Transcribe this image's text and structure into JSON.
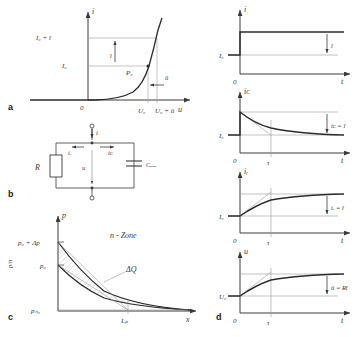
{
  "figure": {
    "panels": [
      "a",
      "b",
      "c",
      "d"
    ],
    "colors": {
      "curve": "#2b2b2b",
      "axis": "#3a3a3a",
      "thin": "#9a9a9a",
      "hatch": "#8a8a8a",
      "text": "#3a3a3a"
    }
  },
  "panel_a": {
    "letter": "a",
    "y_axis_label": "i",
    "x_axis_label": "u",
    "origin_label": "0",
    "y_ticks": [
      "I₀ + î",
      "I₀"
    ],
    "x_ticks": [
      "U₀",
      "U₀ + û"
    ],
    "point_label": "P₀",
    "arrow_labels": [
      "î",
      "û"
    ]
  },
  "panel_b": {
    "letter": "b",
    "total_current": "i",
    "resistor_current": "iᵣ",
    "capacitor_current": "iᴄ",
    "voltage": "u",
    "resistor": "R",
    "capacitor": "Cₑᵢₑₑ"
  },
  "panel_c": {
    "letter": "c",
    "y_axis_label": "p",
    "x_axis_label": "x",
    "origin_label": "",
    "y_ticks": [
      "p₀ + Δp",
      "p₀",
      "pₙ₀"
    ],
    "x_ticks": [
      "Lₚ"
    ],
    "zone_label": "n - Zone",
    "charge_label": "ΔQ",
    "side_label": "p/n"
  },
  "panel_d": {
    "letter": "d",
    "plots": [
      {
        "id": "current-step",
        "y_axis_label": "i",
        "x_axis_label": "t",
        "origin_label": "0",
        "y_tick": "I₀",
        "amplitude_label": "î",
        "tau_label": "",
        "type": "step"
      },
      {
        "id": "capacitor-current",
        "y_axis_label": "iᴄ",
        "x_axis_label": "t",
        "origin_label": "0",
        "y_tick": "I₀",
        "amplitude_label": "iᴄ = î",
        "tau_label": "τ",
        "type": "decay"
      },
      {
        "id": "resistor-current",
        "y_axis_label": "iᵣ",
        "x_axis_label": "t",
        "origin_label": "0",
        "y_tick": "I₀",
        "amplitude_label": "iᵣ = î",
        "tau_label": "τ",
        "type": "rise"
      },
      {
        "id": "voltage",
        "y_axis_label": "u",
        "x_axis_label": "t",
        "origin_label": "0",
        "y_tick": "U₀",
        "amplitude_label": "û = Rî",
        "tau_label": "τ",
        "type": "rise"
      }
    ]
  }
}
